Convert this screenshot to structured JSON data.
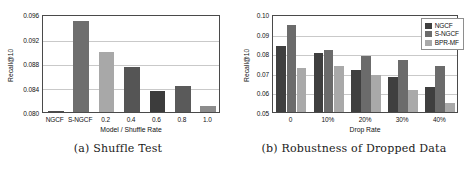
{
  "figure": {
    "subfigures": [
      {
        "caption": "(a) Shuffle Test",
        "chart_data": {
          "type": "bar",
          "title": "",
          "xlabel": "Model / Shuffle Rate",
          "ylabel": "Recall@10",
          "categories": [
            "NGCF",
            "S-NGCF",
            "0.2",
            "0.4",
            "0.6",
            "0.8",
            "1.0"
          ],
          "values": [
            0.0801,
            0.0948,
            0.0898,
            0.0873,
            0.0835,
            0.0842,
            0.081
          ],
          "ylim": [
            0.08,
            0.096
          ],
          "yticks": [
            0.08,
            0.084,
            0.088,
            0.092,
            0.096
          ],
          "ytick_labels": [
            "0.080",
            "0.084",
            "0.088",
            "0.092",
            "0.096"
          ],
          "bar_colors": [
            "#4d4d4d",
            "#6e6e6e",
            "#a8a8a8",
            "#555555",
            "#3c3c3c",
            "#5a5a5a",
            "#8c8c8c"
          ],
          "grid": true,
          "legend": false
        }
      },
      {
        "caption": "(b) Robustness of Dropped Data",
        "chart_data": {
          "type": "bar",
          "title": "",
          "xlabel": "Drop Rate",
          "ylabel": "Recall@10",
          "categories": [
            "0",
            "10%",
            "20%",
            "30%",
            "40%"
          ],
          "series": [
            {
              "name": "NGCF",
              "values": [
                0.0838,
                0.0802,
                0.0716,
                0.068,
                0.0627
              ],
              "color": "#3f3f3f"
            },
            {
              "name": "S-NGCF",
              "values": [
                0.0944,
                0.0817,
                0.0784,
                0.0765,
                0.0733
              ],
              "color": "#6b6b6b"
            },
            {
              "name": "BPR-MF",
              "values": [
                0.0726,
                0.0734,
                0.0691,
                0.061,
                0.0546
              ],
              "color": "#a9a9a9"
            }
          ],
          "ylim": [
            0.05,
            0.1
          ],
          "yticks": [
            0.05,
            0.06,
            0.07,
            0.08,
            0.09,
            0.1
          ],
          "ytick_labels": [
            "0.05",
            "0.06",
            "0.07",
            "0.08",
            "0.09",
            "0.10"
          ],
          "grid": true,
          "legend": true,
          "legend_position": "top-right"
        }
      }
    ]
  }
}
